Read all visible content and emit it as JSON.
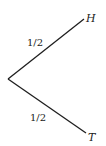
{
  "diagram": {
    "type": "probability-tree",
    "root": {
      "x": 8,
      "y": 79
    },
    "branches": [
      {
        "id": "heads",
        "probability_label": "1/2",
        "outcome_label": "H",
        "end": {
          "x": 84,
          "y": 19
        },
        "prob_pos": {
          "x": 27,
          "y": 46
        },
        "outcome_pos": {
          "x": 86,
          "y": 22
        }
      },
      {
        "id": "tails",
        "probability_label": "1/2",
        "outcome_label": "T",
        "end": {
          "x": 86,
          "y": 133
        },
        "prob_pos": {
          "x": 30,
          "y": 121
        },
        "outcome_pos": {
          "x": 88,
          "y": 141
        }
      }
    ],
    "colors": {
      "line": "#1e1e1e",
      "text": "#222222",
      "background": "#ffffff"
    }
  }
}
